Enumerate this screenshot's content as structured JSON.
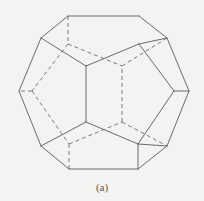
{
  "figure": {
    "caption": "(a)",
    "colors": {
      "background": "#f3f3f1",
      "line": "#6a6a6a"
    },
    "vertices": {
      "A": [
        68,
        16
      ],
      "B": [
        139,
        16
      ],
      "C": [
        167,
        38
      ],
      "D": [
        189,
        91
      ],
      "E": [
        167,
        146
      ],
      "F": [
        138,
        169
      ],
      "G": [
        69,
        169
      ],
      "H": [
        41,
        146
      ],
      "I": [
        19,
        91
      ],
      "J": [
        41,
        38
      ],
      "K": [
        86,
        66
      ],
      "L": [
        139,
        44
      ],
      "M": [
        174,
        91
      ],
      "N": [
        138,
        144
      ],
      "O": [
        86,
        122
      ],
      "P": [
        68,
        44
      ],
      "Q": [
        122,
        66
      ],
      "R": [
        32,
        91
      ],
      "S": [
        69,
        144
      ],
      "T": [
        122,
        122
      ]
    },
    "solid_edges": [
      [
        "A",
        "B"
      ],
      [
        "B",
        "C"
      ],
      [
        "C",
        "D"
      ],
      [
        "D",
        "E"
      ],
      [
        "E",
        "F"
      ],
      [
        "F",
        "G"
      ],
      [
        "G",
        "H"
      ],
      [
        "H",
        "I"
      ],
      [
        "I",
        "J"
      ],
      [
        "J",
        "A"
      ],
      [
        "J",
        "K"
      ],
      [
        "K",
        "L"
      ],
      [
        "L",
        "C"
      ],
      [
        "L",
        "M"
      ],
      [
        "M",
        "D"
      ],
      [
        "M",
        "N"
      ],
      [
        "N",
        "E"
      ],
      [
        "N",
        "O"
      ],
      [
        "O",
        "K"
      ],
      [
        "O",
        "H"
      ],
      [
        "N",
        "F"
      ]
    ],
    "hidden_edges": [
      [
        "A",
        "P"
      ],
      [
        "P",
        "Q"
      ],
      [
        "Q",
        "C"
      ],
      [
        "P",
        "R"
      ],
      [
        "R",
        "I"
      ],
      [
        "R",
        "S"
      ],
      [
        "S",
        "G"
      ],
      [
        "S",
        "T"
      ],
      [
        "T",
        "E"
      ],
      [
        "T",
        "Q"
      ]
    ]
  }
}
